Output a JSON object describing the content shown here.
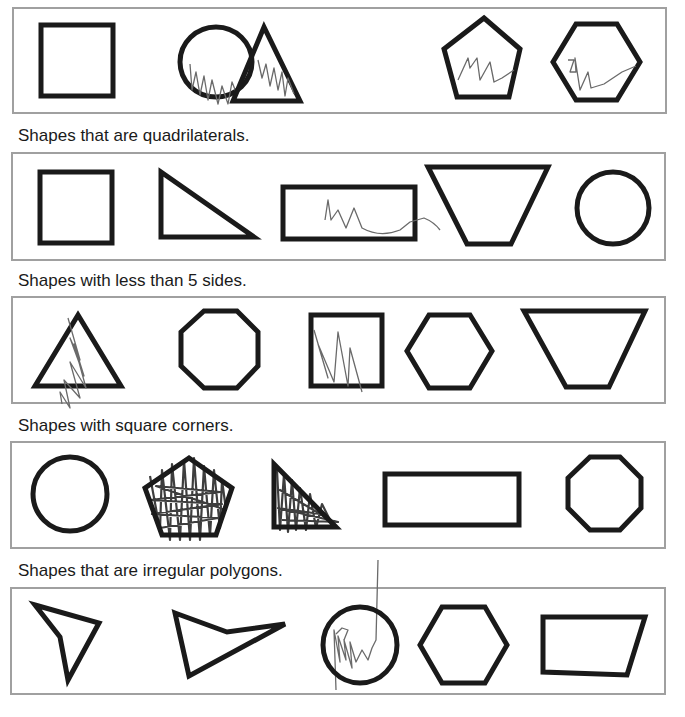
{
  "worksheet": {
    "sections": [
      {
        "heading": "",
        "shapes": [
          {
            "name": "square",
            "marked": false
          },
          {
            "name": "circle",
            "marked": true
          },
          {
            "name": "triangle",
            "marked": true
          },
          {
            "name": "pentagon",
            "marked": true
          },
          {
            "name": "hexagon",
            "marked": true
          }
        ]
      },
      {
        "heading": "Shapes that are quadrilaterals.",
        "shapes": [
          {
            "name": "square",
            "marked": false
          },
          {
            "name": "right-triangle",
            "marked": false
          },
          {
            "name": "rectangle",
            "marked": true
          },
          {
            "name": "trapezoid",
            "marked": false
          },
          {
            "name": "circle",
            "marked": false
          }
        ]
      },
      {
        "heading": "Shapes with less than 5 sides.",
        "shapes": [
          {
            "name": "triangle",
            "marked": true
          },
          {
            "name": "octagon",
            "marked": false
          },
          {
            "name": "square",
            "marked": true
          },
          {
            "name": "hexagon",
            "marked": false
          },
          {
            "name": "trapezoid",
            "marked": false
          }
        ]
      },
      {
        "heading": "Shapes with square corners.",
        "shapes": [
          {
            "name": "circle",
            "marked": false
          },
          {
            "name": "pentagon",
            "marked": true
          },
          {
            "name": "right-triangle",
            "marked": true
          },
          {
            "name": "rectangle",
            "marked": false
          },
          {
            "name": "octagon",
            "marked": false
          }
        ]
      },
      {
        "heading": "Shapes that are irregular polygons.",
        "shapes": [
          {
            "name": "irregular-quadrilateral-concave",
            "marked": false
          },
          {
            "name": "irregular-quadrilateral-arrow",
            "marked": false
          },
          {
            "name": "circle",
            "marked": true
          },
          {
            "name": "hexagon",
            "marked": false
          },
          {
            "name": "irregular-quadrilateral",
            "marked": false
          }
        ]
      }
    ],
    "colors": {
      "shape_stroke": "#1a1a1a",
      "box_border": "#a0a0a0",
      "scribble": "#6a6a6a",
      "background": "#ffffff"
    }
  }
}
